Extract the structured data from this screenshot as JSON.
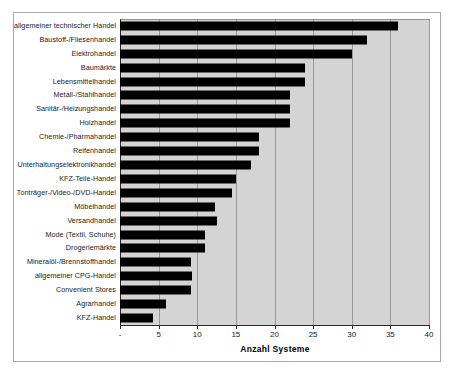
{
  "chart_data": {
    "type": "bar",
    "orientation": "horizontal",
    "title": "",
    "xlabel": "Anzahl Systeme",
    "ylabel": "",
    "xlim": [
      0,
      40
    ],
    "xticks": [
      0,
      5,
      10,
      15,
      20,
      25,
      30,
      35,
      40
    ],
    "xtick_labels": [
      "-",
      "5",
      "10",
      "15",
      "20",
      "25",
      "30",
      "35",
      "40"
    ],
    "grid": true,
    "legend": false,
    "bar_color": "#000000",
    "plot_background": "#d4d4d4",
    "categories": [
      "allgemeiner technischer Handel",
      "Baustoff-/Fliesenhandel",
      "Elektrohandel",
      "Baumärkte",
      "Lebensmittelhandel",
      "Metall-/Stahlhandel",
      "Sanitär-/Heizungshandel",
      "Holzhandel",
      "Chemie-/Pharmahandel",
      "Reifenhandel",
      "Unterhaltungselektronikhandel",
      "KFZ-Teile-Handel",
      "Tonträger-/Video-/DVD-Handel",
      "Möbelhandel",
      "Versandhandel",
      "Mode (Textil, Schuhe)",
      "Drogeriemärkte",
      "Mineralöl-/Brennstoffhandel",
      "allgemeiner CPG-Handel",
      "Convenient Stores",
      "Agrarhandel",
      "KFZ-Handel"
    ],
    "values": [
      36,
      32,
      30,
      24,
      24,
      22,
      22,
      22,
      18,
      18,
      17,
      15,
      14.5,
      12.3,
      12.5,
      11,
      11,
      9.2,
      9.3,
      9.2,
      6,
      4.3
    ]
  }
}
